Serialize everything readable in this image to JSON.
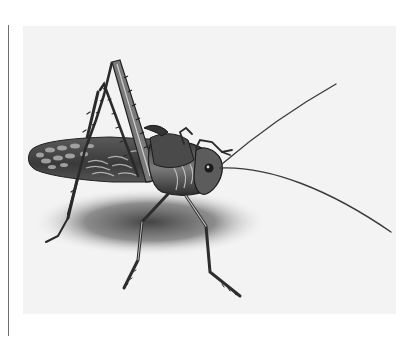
{
  "figure": {
    "subject": "katydid",
    "colors": {
      "background": "#ffffff",
      "panel": "#f3f3f3",
      "rule": "#6e6e6e",
      "body_dark": "#2b2b2b",
      "body_mid": "#6a6a6a",
      "body_light": "#bdbdbd",
      "shadow": "#5a5a5a"
    }
  }
}
